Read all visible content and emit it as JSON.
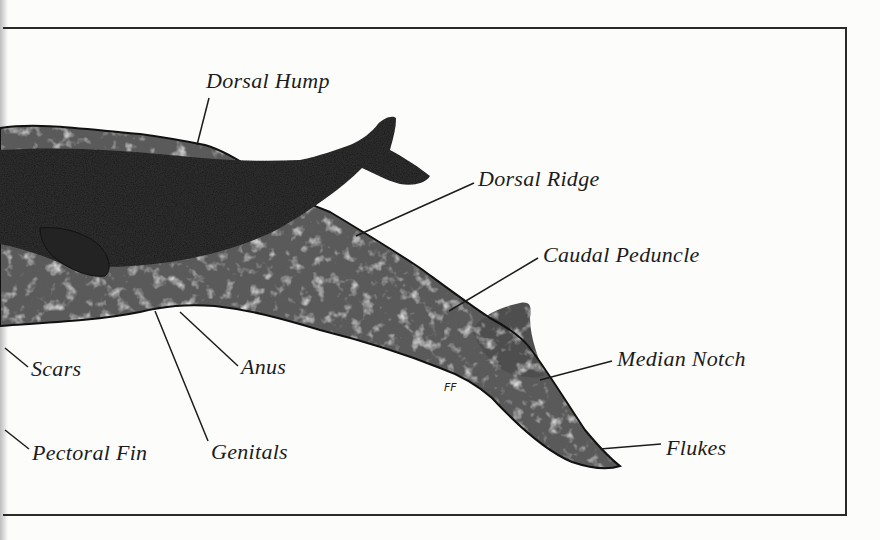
{
  "figure": {
    "artist_monogram": "FF",
    "colors": {
      "ink": "#1c1c1c",
      "paper": "#fcfcfb",
      "frame": "#2a2a2a",
      "mother_mottle": "#6b6b6b",
      "calf_body": "#2c2c2c"
    }
  },
  "labels": [
    {
      "id": "dorsal-hump",
      "text": "Dorsal Hump",
      "x": 206,
      "y": 70,
      "leader": [
        [
          209,
          98
        ],
        [
          197,
          145
        ]
      ]
    },
    {
      "id": "dorsal-ridge",
      "text": "Dorsal Ridge",
      "x": 478,
      "y": 168,
      "leader": [
        [
          474,
          183
        ],
        [
          356,
          236
        ]
      ]
    },
    {
      "id": "caudal-peduncle",
      "text": "Caudal Peduncle",
      "x": 543,
      "y": 244,
      "leader": [
        [
          538,
          258
        ],
        [
          449,
          311
        ]
      ]
    },
    {
      "id": "median-notch",
      "text": "Median Notch",
      "x": 617,
      "y": 348,
      "leader": [
        [
          612,
          361
        ],
        [
          540,
          380
        ]
      ]
    },
    {
      "id": "flukes",
      "text": "Flukes",
      "x": 666,
      "y": 437,
      "leader": [
        [
          661,
          444
        ],
        [
          600,
          449
        ]
      ]
    },
    {
      "id": "scars",
      "text": "Scars",
      "x": 31,
      "y": 358,
      "leader": [
        [
          28,
          367
        ],
        [
          5,
          348
        ]
      ]
    },
    {
      "id": "anus",
      "text": "Anus",
      "x": 241,
      "y": 356,
      "leader": [
        [
          238,
          366
        ],
        [
          180,
          312
        ]
      ]
    },
    {
      "id": "pectoral-fin",
      "text": "Pectoral Fin",
      "x": 32,
      "y": 442,
      "leader": [
        [
          29,
          449
        ],
        [
          5,
          430
        ]
      ]
    },
    {
      "id": "genitals",
      "text": "Genitals",
      "x": 211,
      "y": 441,
      "leader": [
        [
          208,
          441
        ],
        [
          155,
          311
        ]
      ]
    }
  ]
}
